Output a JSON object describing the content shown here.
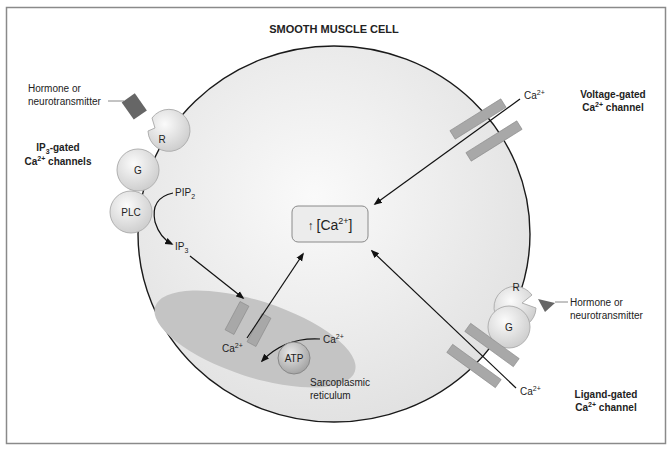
{
  "title": "SMOOTH MUSCLE CELL",
  "center_box": {
    "arrow": "↑",
    "text": "[Ca",
    "sup": "2+",
    "close": "]"
  },
  "left_receptor": {
    "ligand_label_line1": "Hormone or",
    "ligand_label_line2": "neurotransmitter",
    "receptor": "R",
    "g_protein": "G",
    "enzyme": "PLC",
    "channel_label_line1_pre": "IP",
    "channel_label_line1_sub": "3",
    "channel_label_line1_post": "-gated",
    "channel_label_line2_pre": "Ca",
    "channel_label_line2_sup": "2+",
    "channel_label_line2_post": " channels"
  },
  "pathway": {
    "pip2_pre": "PIP",
    "pip2_sub": "2",
    "ip3_pre": "IP",
    "ip3_sub": "3"
  },
  "sr": {
    "ca_release_pre": "Ca",
    "ca_release_sup": "2+",
    "ca_uptake_pre": "Ca",
    "ca_uptake_sup": "2+",
    "pump": "ATP",
    "label_line1": "Sarcoplasmic",
    "label_line2": "reticulum"
  },
  "voltage_channel": {
    "ion_pre": "Ca",
    "ion_sup": "2+",
    "label_line1": "Voltage-gated",
    "label_line2_pre": "Ca",
    "label_line2_sup": "2+",
    "label_line2_post": " channel"
  },
  "ligand_channel": {
    "receptor": "R",
    "g_protein": "G",
    "ligand_label_line1": "Hormone or",
    "ligand_label_line2": "neurotransmitter",
    "ion_pre": "Ca",
    "ion_sup": "2+",
    "label_line1": "Ligand-gated",
    "label_line2_pre": "Ca",
    "label_line2_sup": "2+",
    "label_line2_post": " channel"
  },
  "colors": {
    "frame": "#8a8a8a",
    "cell_fill": "#ededed",
    "cell_stroke": "#1a1a1a",
    "channel": "#a8a8a8",
    "sr_fill": "#c4c4c4",
    "ligand_dark": "#666666",
    "circle_fill": "#e4e4e4"
  }
}
